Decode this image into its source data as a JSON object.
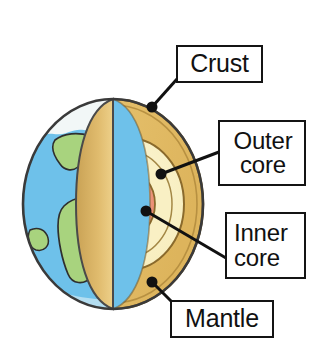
{
  "diagram": {
    "labels": [
      {
        "id": "crust",
        "lines": [
          "Crust"
        ],
        "dot": [
          152,
          107
        ]
      },
      {
        "id": "outer_core",
        "lines": [
          "Outer",
          "core"
        ],
        "dot": [
          161,
          174
        ]
      },
      {
        "id": "inner_core",
        "lines": [
          "Inner",
          "core"
        ],
        "dot": [
          146,
          211
        ]
      },
      {
        "id": "mantle",
        "lines": [
          "Mantle"
        ],
        "dot": [
          152,
          282
        ]
      }
    ],
    "layers": [
      {
        "name": "crust",
        "color": "#e8c97c"
      },
      {
        "name": "mantle",
        "color": "#e5c06a"
      },
      {
        "name": "outer_core",
        "color": "#f8efc0"
      },
      {
        "name": "inner_core",
        "color": "#ef9a82"
      }
    ],
    "surface": {
      "ocean_color": "#6ec1ea",
      "land_color": "#a8d37e",
      "polar_color": "#f2f7f7",
      "outline_color": "#3a3a3a"
    },
    "leader_color": "#111111",
    "box_border_color": "#141414",
    "background": "#ffffff"
  }
}
